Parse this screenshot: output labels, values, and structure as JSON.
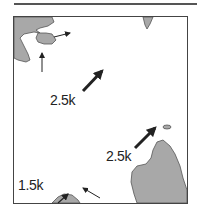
{
  "figure": {
    "colors": {
      "land": "#a8a8a8",
      "land_outline": "#555555",
      "arrow": "#222222",
      "frame": "#444444"
    },
    "labels": [
      {
        "id": "flow-center",
        "text": "2.5k"
      },
      {
        "id": "flow-right",
        "text": "2.5k"
      },
      {
        "id": "flow-bottom-left",
        "text": "1.5k"
      }
    ],
    "arrows": [
      {
        "id": "arrow-top-left-east",
        "weight": "thin"
      },
      {
        "id": "arrow-top-left-north",
        "weight": "thin"
      },
      {
        "id": "arrow-center-northeast",
        "weight": "thick"
      },
      {
        "id": "arrow-right-northeast",
        "weight": "thick"
      },
      {
        "id": "arrow-bottom-northwest",
        "weight": "thin"
      },
      {
        "id": "arrow-bottom-island-north",
        "weight": "thin"
      }
    ]
  }
}
